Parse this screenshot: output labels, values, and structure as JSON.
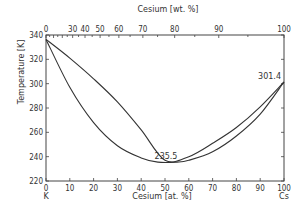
{
  "chart_data": {
    "type": "line",
    "title": "",
    "xlabel": "Cesium [at. %]",
    "xlabel_top": "Cesium [wt. %]",
    "ylabel": "Temperature [K]",
    "xlim": [
      0,
      100
    ],
    "ylim": [
      220,
      340
    ],
    "grid": false,
    "x_ticks": [
      0,
      10,
      20,
      30,
      40,
      50,
      60,
      70,
      80,
      90,
      100
    ],
    "x_ticks_top": [
      0,
      30,
      40,
      50,
      60,
      70,
      80,
      90,
      100
    ],
    "y_ticks": [
      220,
      240,
      260,
      280,
      300,
      320,
      340
    ],
    "endpoint_labels": {
      "left": "K",
      "right": "Cs"
    },
    "series": [
      {
        "name": "liquidus",
        "x": [
          0,
          10,
          20,
          30,
          40,
          50,
          60,
          70,
          80,
          90,
          100
        ],
        "y": [
          336.4,
          321,
          304,
          285,
          262,
          237,
          240,
          251,
          264,
          281,
          301.4
        ]
      },
      {
        "name": "solidus",
        "x": [
          0,
          10,
          20,
          30,
          40,
          47,
          55,
          60,
          70,
          80,
          90,
          100
        ],
        "y": [
          336.4,
          297,
          268,
          249,
          239,
          235.5,
          235.5,
          237,
          244,
          257,
          275,
          301.4
        ]
      }
    ],
    "annotations": [
      {
        "text": "235.5",
        "x": 50,
        "y": 235.5
      },
      {
        "text": "301.4",
        "x": 100,
        "y": 301.4
      }
    ]
  }
}
